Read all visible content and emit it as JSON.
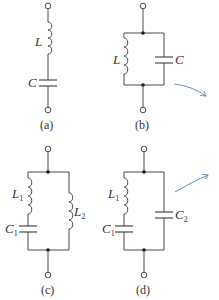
{
  "figure": {
    "panels": [
      {
        "id": "a",
        "caption": "(a)",
        "description": "series LC",
        "components": [
          {
            "label": "L",
            "type": "inductor"
          },
          {
            "label": "C",
            "type": "capacitor"
          }
        ]
      },
      {
        "id": "b",
        "caption": "(b)",
        "description": "parallel LC",
        "components": [
          {
            "label": "L",
            "type": "inductor"
          },
          {
            "label": "C",
            "type": "capacitor"
          }
        ]
      },
      {
        "id": "c",
        "caption": "(c)",
        "description": "L1-C1 series branch in parallel with L2",
        "components": [
          {
            "label": "L",
            "sub": "1",
            "type": "inductor"
          },
          {
            "label": "C",
            "sub": "1",
            "type": "capacitor"
          },
          {
            "label": "L",
            "sub": "2",
            "type": "inductor"
          }
        ]
      },
      {
        "id": "d",
        "caption": "(d)",
        "description": "L1-C1 series branch in parallel with C2",
        "components": [
          {
            "label": "L",
            "sub": "1",
            "type": "inductor"
          },
          {
            "label": "C",
            "sub": "1",
            "type": "capacitor"
          },
          {
            "label": "C",
            "sub": "2",
            "type": "capacitor"
          }
        ]
      }
    ],
    "colors": {
      "wire": "#4a4a4a",
      "arrow": "#6b8fb5",
      "background": "#ffffff"
    }
  }
}
